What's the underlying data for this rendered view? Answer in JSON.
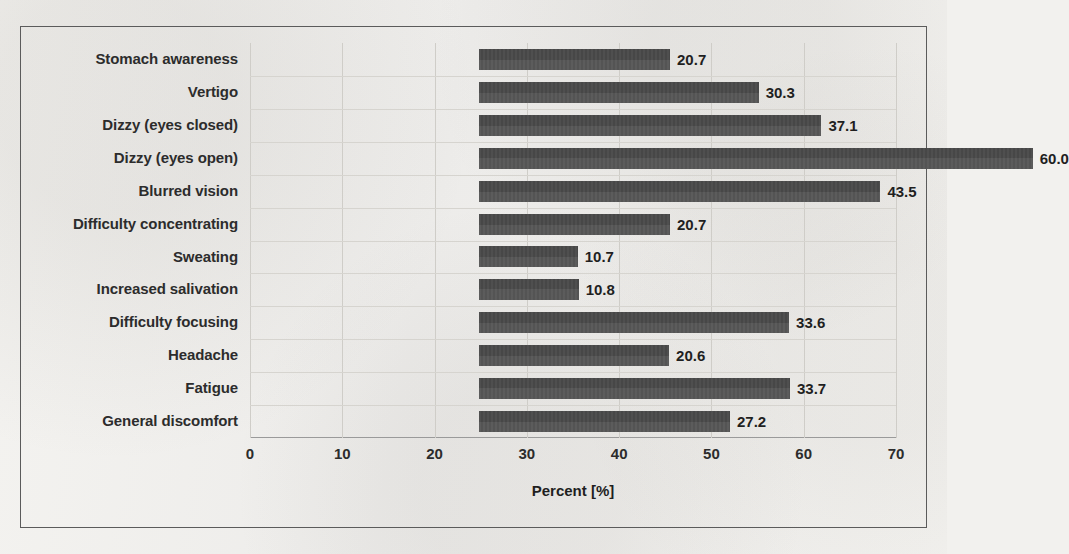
{
  "chart_data": {
    "type": "bar",
    "orientation": "horizontal",
    "title": "",
    "xlabel": "Percent [%]",
    "ylabel": "",
    "xlim": [
      0,
      70
    ],
    "xticks": [
      0,
      10,
      20,
      30,
      40,
      50,
      60,
      70
    ],
    "xtick_labels": [
      "0",
      "10",
      "20",
      "30",
      "40",
      "50",
      "60",
      "70"
    ],
    "grid": true,
    "legend": false,
    "bar_color": "#4d4d4d",
    "value_label_format": "one-decimal",
    "categories": [
      "Stomach awareness",
      "Vertigo",
      "Dizzy (eyes closed)",
      "Dizzy (eyes open)",
      "Blurred vision",
      "Difficulty concentrating",
      "Sweating",
      "Increased salivation",
      "Difficulty focusing",
      "Headache",
      "Fatigue",
      "General discomfort"
    ],
    "values": [
      20.7,
      30.3,
      37.1,
      60.0,
      43.5,
      20.7,
      10.7,
      10.8,
      33.6,
      20.6,
      33.7,
      27.2
    ],
    "value_labels": [
      "20.7",
      "30.3",
      "37.1",
      "60.0",
      "43.5",
      "20.7",
      "10.7",
      "10.8",
      "33.6",
      "20.6",
      "33.7",
      "27.2"
    ]
  }
}
